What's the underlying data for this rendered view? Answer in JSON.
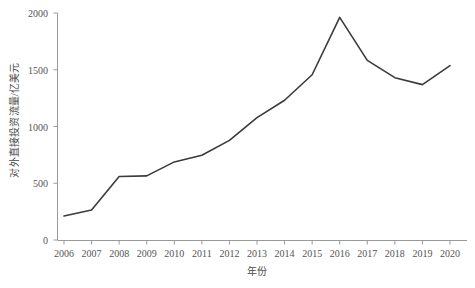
{
  "chart_data": {
    "type": "line",
    "title": "",
    "xlabel": "年份",
    "ylabel": "对外直接投资流量/亿美元",
    "categories": [
      "2006",
      "2007",
      "2008",
      "2009",
      "2010",
      "2011",
      "2012",
      "2013",
      "2014",
      "2015",
      "2016",
      "2017",
      "2018",
      "2019",
      "2020"
    ],
    "values": [
      211,
      265,
      559,
      565,
      688,
      747,
      878,
      1078,
      1231,
      1456,
      1961,
      1583,
      1430,
      1369,
      1537
    ],
    "series": [
      {
        "name": "对外直接投资流量",
        "values": [
          211,
          265,
          559,
          565,
          688,
          747,
          878,
          1078,
          1231,
          1456,
          1961,
          1583,
          1430,
          1369,
          1537
        ]
      }
    ],
    "ylim": [
      0,
      2000
    ],
    "ytick_labels": [
      "0",
      "500",
      "1000",
      "1500",
      "2000"
    ],
    "ytick_values": [
      0,
      500,
      1000,
      1500,
      2000
    ],
    "xtick_labels": [
      "2006",
      "2007",
      "2008",
      "2009",
      "2010",
      "2011",
      "2012",
      "2013",
      "2014",
      "2015",
      "2016",
      "2017",
      "2018",
      "2019",
      "2020"
    ],
    "grid": false,
    "legend": "none",
    "line_color": "#3b3b3b",
    "axis_color": "#9a9a9a",
    "background_color": "#ffffff"
  },
  "axes": {
    "y_axis_title": "对外直接投资流量/亿美元",
    "x_axis_title": "年份"
  }
}
